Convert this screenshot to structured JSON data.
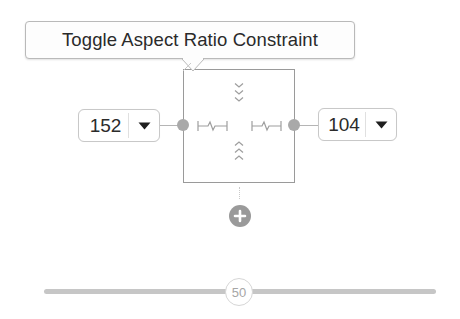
{
  "tooltip": {
    "text": "Toggle Aspect Ratio Constraint"
  },
  "constraints": {
    "leading": {
      "value": "152",
      "arrow_icon": "dropdown-triangle"
    },
    "trailing": {
      "value": "104",
      "arrow_icon": "dropdown-triangle"
    },
    "vertical_indicators": {
      "top": "chevrons-down",
      "bottom": "chevrons-up"
    },
    "horizontal_indicators": {
      "left": "spring",
      "right": "spring"
    }
  },
  "add_button": {
    "icon": "plus-circle"
  },
  "slider": {
    "value": "50",
    "min": 0,
    "max": 100
  },
  "colors": {
    "anchor": "#a9a9a9",
    "border": "#9a9a9a",
    "track": "#c6c6c6",
    "text": "#2b2b2b"
  }
}
